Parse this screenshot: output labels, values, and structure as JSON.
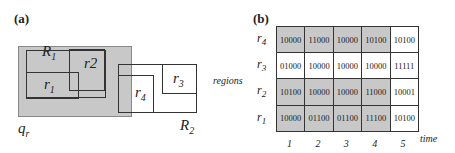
{
  "panel_a": {
    "label": "(a)",
    "region_labels": {
      "R1": "R",
      "R1_sub": "1",
      "R2": "R",
      "R2_sub": "2",
      "r1": "r",
      "r1_sub": "1",
      "r2": "r2",
      "r3": "r",
      "r3_sub": "3",
      "r4": "r",
      "r4_sub": "4",
      "qr": "q",
      "qr_sub": "r"
    }
  },
  "panel_b": {
    "label": "(b)",
    "y_axis_label": "regions",
    "x_axis_label": "time",
    "row_labels": [
      {
        "t": "r",
        "s": "4"
      },
      {
        "t": "r",
        "s": "3"
      },
      {
        "t": "r",
        "s": "2"
      },
      {
        "t": "r",
        "s": "1"
      }
    ],
    "col_labels": [
      "1",
      "2",
      "3",
      "4",
      "5"
    ],
    "rows": [
      [
        "10000",
        "11000",
        "10000",
        "10100",
        "10100"
      ],
      [
        "01000",
        "10000",
        "10000",
        "10000",
        "11111"
      ],
      [
        "10100",
        "10000",
        "10000",
        "11000",
        "10001"
      ],
      [
        "10000",
        "01100",
        "01100",
        "11100",
        "10100"
      ]
    ],
    "shaded_rows": [
      0,
      2,
      3
    ],
    "shaded_cols": 4,
    "shade_color": "#c8c8c8"
  }
}
